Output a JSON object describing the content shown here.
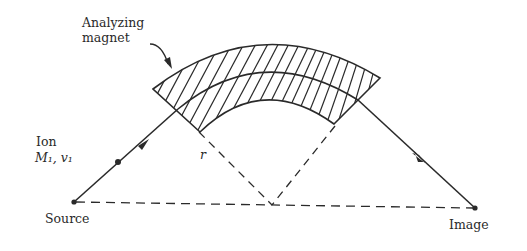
{
  "diagram": {
    "type": "mass-spectrometer-schematic",
    "labels": {
      "magnet_line1": "Analyzing",
      "magnet_line2": "magnet",
      "ion_line1": "Ion",
      "ion_line2": "M₁, v₁",
      "radius": "r",
      "source": "Source",
      "image": "Image"
    },
    "colors": {
      "ink": "#2a2a2a",
      "background": "#ffffff"
    }
  }
}
